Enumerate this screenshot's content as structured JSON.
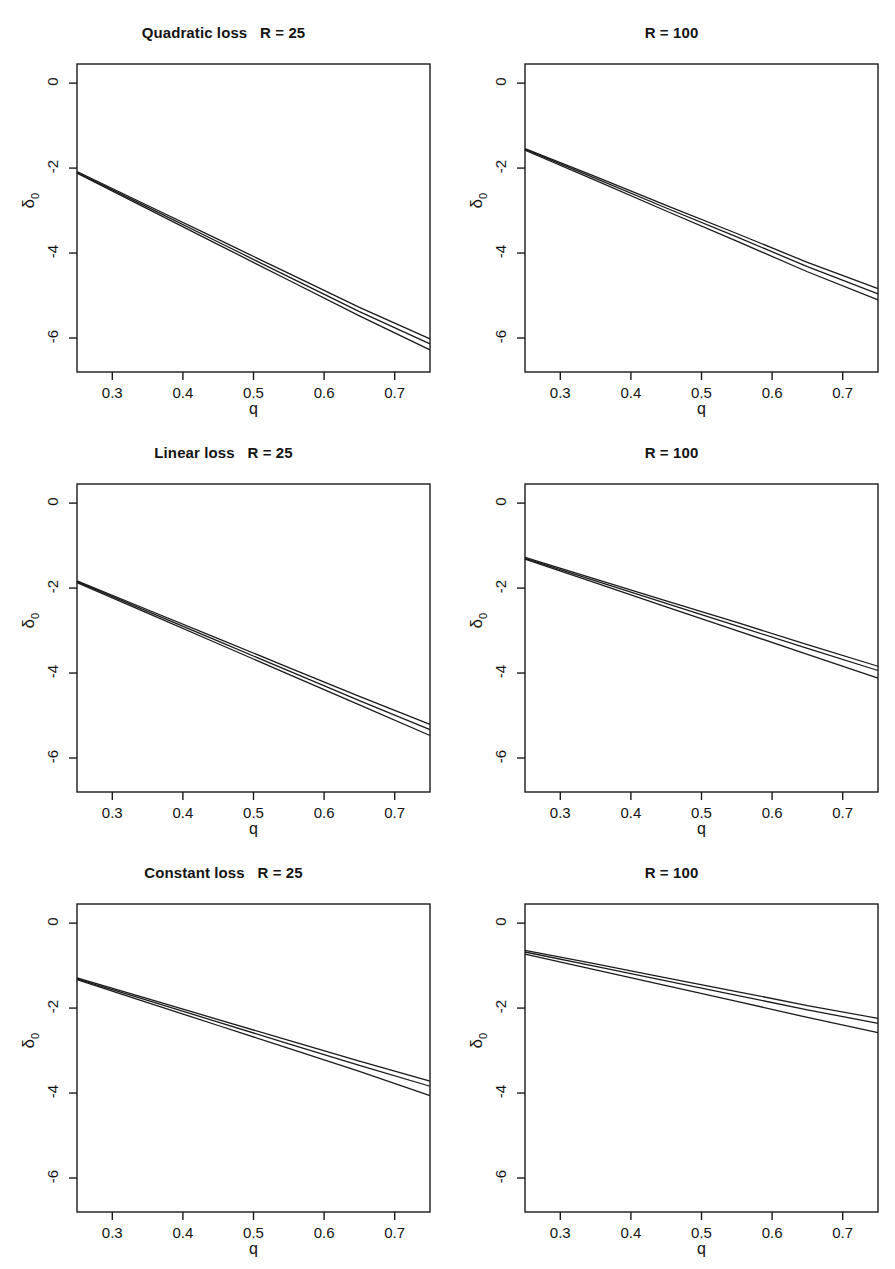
{
  "figure": {
    "background_color": "#ffffff",
    "line_color": "#1a1a1a",
    "axis_color": "#1a1a1a",
    "rows": 3,
    "cols": 2
  },
  "axes": {
    "x_label": "q",
    "y_label_base": "δ",
    "y_label_sub": "0",
    "x_ticks": [
      "0.3",
      "0.4",
      "0.5",
      "0.6",
      "0.7"
    ],
    "x_tick_values": [
      0.3,
      0.4,
      0.5,
      0.6,
      0.7
    ],
    "y_ticks": [
      "0",
      "-2",
      "-4",
      "-6"
    ],
    "y_tick_values": [
      0,
      -2,
      -4,
      -6
    ],
    "xlim": [
      0.25,
      0.75
    ],
    "ylim": [
      -6.8,
      0.45
    ]
  },
  "panels": [
    {
      "id": "quadratic-r25",
      "title": "Quadratic loss   R = 25",
      "loss": "Quadratic loss",
      "R": 25
    },
    {
      "id": "quadratic-r100",
      "title": "R = 100",
      "loss": "Quadratic loss",
      "R": 100
    },
    {
      "id": "linear-r25",
      "title": "Linear loss   R = 25",
      "loss": "Linear loss",
      "R": 25
    },
    {
      "id": "linear-r100",
      "title": "R = 100",
      "loss": "Linear loss",
      "R": 100
    },
    {
      "id": "constant-r25",
      "title": "Constant loss   R = 25",
      "loss": "Constant loss",
      "R": 25
    },
    {
      "id": "constant-r100",
      "title": "R = 100",
      "loss": "Constant loss",
      "R": 100
    }
  ],
  "chart_data": [
    {
      "type": "line",
      "title": "Quadratic loss   R = 25",
      "xlabel": "q",
      "ylabel": "δ₀",
      "xlim": [
        0.25,
        0.75
      ],
      "ylim": [
        -6.8,
        0.45
      ],
      "grid": false,
      "legend": "none",
      "x": [
        0.25,
        0.35,
        0.45,
        0.55,
        0.65,
        0.75
      ],
      "series": [
        {
          "name": "upper",
          "values": [
            -2.08,
            -2.88,
            -3.68,
            -4.48,
            -5.28,
            -6.02
          ]
        },
        {
          "name": "middle",
          "values": [
            -2.1,
            -2.92,
            -3.74,
            -4.56,
            -5.38,
            -6.14
          ]
        },
        {
          "name": "lower",
          "values": [
            -2.12,
            -2.96,
            -3.8,
            -4.64,
            -5.48,
            -6.28
          ]
        }
      ]
    },
    {
      "type": "line",
      "title": "R = 100",
      "xlabel": "q",
      "ylabel": "δ₀",
      "xlim": [
        0.25,
        0.75
      ],
      "ylim": [
        -6.8,
        0.45
      ],
      "grid": false,
      "legend": "none",
      "x": [
        0.25,
        0.35,
        0.45,
        0.55,
        0.65,
        0.75
      ],
      "series": [
        {
          "name": "upper",
          "values": [
            -1.54,
            -2.2,
            -2.88,
            -3.54,
            -4.22,
            -4.84
          ]
        },
        {
          "name": "middle",
          "values": [
            -1.56,
            -2.24,
            -2.94,
            -3.62,
            -4.32,
            -4.96
          ]
        },
        {
          "name": "lower",
          "values": [
            -1.58,
            -2.29,
            -3.01,
            -3.72,
            -4.44,
            -5.1
          ]
        }
      ]
    },
    {
      "type": "line",
      "title": "Linear loss   R = 25",
      "xlabel": "q",
      "ylabel": "δ₀",
      "xlim": [
        0.25,
        0.75
      ],
      "ylim": [
        -6.8,
        0.45
      ],
      "grid": false,
      "legend": "none",
      "x": [
        0.25,
        0.35,
        0.45,
        0.55,
        0.65,
        0.75
      ],
      "series": [
        {
          "name": "upper",
          "values": [
            -1.83,
            -2.51,
            -3.19,
            -3.87,
            -4.55,
            -5.21
          ]
        },
        {
          "name": "middle",
          "values": [
            -1.85,
            -2.55,
            -3.25,
            -3.95,
            -4.65,
            -5.33
          ]
        },
        {
          "name": "lower",
          "values": [
            -1.87,
            -2.59,
            -3.31,
            -4.03,
            -4.75,
            -5.47
          ]
        }
      ]
    },
    {
      "type": "line",
      "title": "R = 100",
      "xlabel": "q",
      "ylabel": "δ₀",
      "xlim": [
        0.25,
        0.75
      ],
      "ylim": [
        -6.8,
        0.45
      ],
      "grid": false,
      "legend": "none",
      "x": [
        0.25,
        0.35,
        0.45,
        0.55,
        0.65,
        0.75
      ],
      "series": [
        {
          "name": "upper",
          "values": [
            -1.28,
            -1.79,
            -2.3,
            -2.81,
            -3.33,
            -3.84
          ]
        },
        {
          "name": "middle",
          "values": [
            -1.3,
            -1.83,
            -2.36,
            -2.89,
            -3.42,
            -3.94
          ]
        },
        {
          "name": "lower",
          "values": [
            -1.32,
            -1.88,
            -2.44,
            -3.0,
            -3.56,
            -4.12
          ]
        }
      ]
    },
    {
      "type": "line",
      "title": "Constant loss   R = 25",
      "xlabel": "q",
      "ylabel": "δ₀",
      "xlim": [
        0.25,
        0.75
      ],
      "ylim": [
        -6.8,
        0.45
      ],
      "grid": false,
      "legend": "none",
      "x": [
        0.25,
        0.35,
        0.45,
        0.55,
        0.65,
        0.75
      ],
      "series": [
        {
          "name": "upper",
          "values": [
            -1.29,
            -1.78,
            -2.27,
            -2.76,
            -3.25,
            -3.72
          ]
        },
        {
          "name": "middle",
          "values": [
            -1.31,
            -1.82,
            -2.33,
            -2.84,
            -3.35,
            -3.84
          ]
        },
        {
          "name": "lower",
          "values": [
            -1.33,
            -1.87,
            -2.41,
            -2.95,
            -3.49,
            -4.06
          ]
        }
      ]
    },
    {
      "type": "line",
      "title": "R = 100",
      "xlabel": "q",
      "ylabel": "δ₀",
      "xlim": [
        0.25,
        0.75
      ],
      "ylim": [
        -6.8,
        0.45
      ],
      "grid": false,
      "legend": "none",
      "x": [
        0.25,
        0.35,
        0.45,
        0.55,
        0.65,
        0.75
      ],
      "series": [
        {
          "name": "upper",
          "values": [
            -0.64,
            -0.96,
            -1.29,
            -1.61,
            -1.94,
            -2.24
          ]
        },
        {
          "name": "middle",
          "values": [
            -0.68,
            -1.02,
            -1.36,
            -1.7,
            -2.04,
            -2.36
          ]
        },
        {
          "name": "lower",
          "values": [
            -0.73,
            -1.1,
            -1.47,
            -1.84,
            -2.22,
            -2.58
          ]
        }
      ]
    }
  ]
}
